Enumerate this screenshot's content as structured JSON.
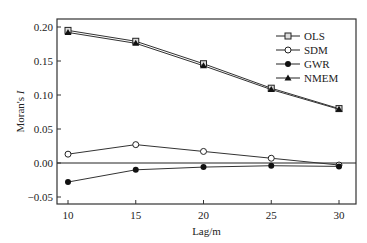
{
  "chart_data": {
    "type": "line",
    "title": "",
    "xlabel": "Lag/m",
    "ylabel": "Moran's I",
    "x": [
      10,
      15,
      20,
      25,
      30
    ],
    "xticks": [
      "10",
      "15",
      "20",
      "25",
      "30"
    ],
    "yticks": [
      "-0.05",
      "0.00",
      "0.05",
      "0.10",
      "0.15",
      "0.20"
    ],
    "ylim": [
      -0.06,
      0.21
    ],
    "xlim": [
      9,
      31
    ],
    "legend_position": "upper right",
    "series": [
      {
        "name": "OLS",
        "marker": "square-open",
        "values": [
          0.195,
          0.179,
          0.146,
          0.11,
          0.08
        ]
      },
      {
        "name": "SDM",
        "marker": "circle-open",
        "values": [
          0.013,
          0.027,
          0.017,
          0.007,
          -0.003
        ]
      },
      {
        "name": "GWR",
        "marker": "circle-filled",
        "values": [
          -0.028,
          -0.01,
          -0.006,
          -0.004,
          -0.005
        ]
      },
      {
        "name": "NMEM",
        "marker": "triangle-filled",
        "values": [
          0.192,
          0.176,
          0.143,
          0.108,
          0.079
        ]
      }
    ]
  }
}
